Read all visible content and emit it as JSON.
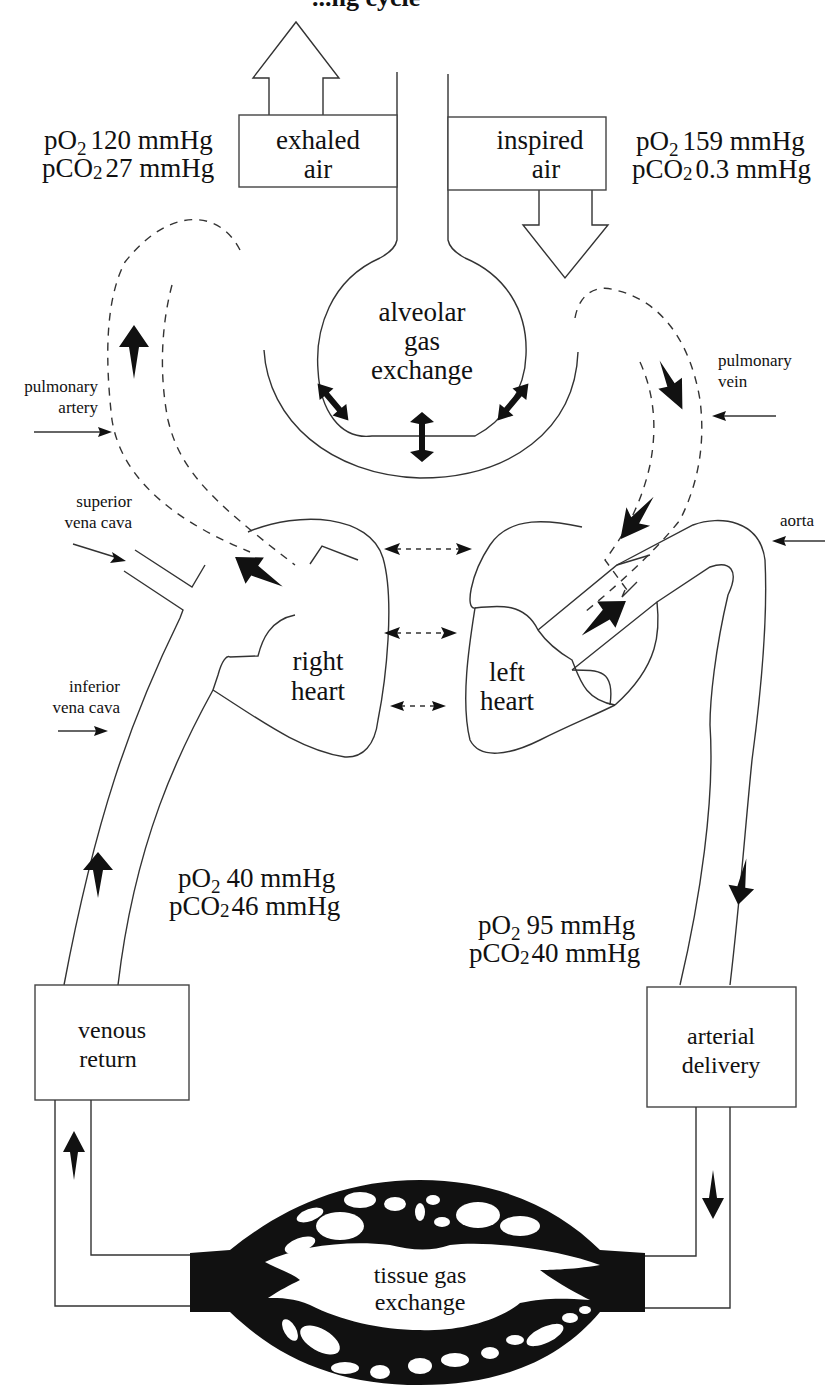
{
  "title_fragment": "...ng cycle",
  "top": {
    "exhaled_box": {
      "line1": "exhaled",
      "line2": "air"
    },
    "inspired_box": {
      "line1": "inspired",
      "line2": "air"
    },
    "exhaled_gas": {
      "po2_prefix": "pO",
      "po2_sub": "2",
      "po2_value": "120 mmHg",
      "pco2_prefix": "pCO",
      "pco2_sub": "2",
      "pco2_value": "27 mmHg"
    },
    "inspired_gas": {
      "po2_prefix": "pO",
      "po2_sub": "2",
      "po2_value": "159 mmHg",
      "pco2_prefix": "pCO",
      "pco2_sub": "2",
      "pco2_value": "0.3 mmHg"
    }
  },
  "alveolus": {
    "line1": "alveolar",
    "line2": "gas",
    "line3": "exchange"
  },
  "vessel_labels": {
    "pulmonary_artery": {
      "line1": "pulmonary",
      "line2": "artery"
    },
    "pulmonary_vein": {
      "line1": "pulmonary",
      "line2": "vein"
    },
    "superior_vena_cava": {
      "line1": "superior",
      "line2": "vena cava"
    },
    "inferior_vena_cava": {
      "line1": "inferior",
      "line2": "vena cava"
    },
    "aorta": {
      "line1": "aorta"
    }
  },
  "hearts": {
    "right": {
      "line1": "right",
      "line2": "heart"
    },
    "left": {
      "line1": "left",
      "line2": "heart"
    }
  },
  "venous_gas": {
    "po2_prefix": "pO",
    "po2_sub": "2",
    "po2_value": "40 mmHg",
    "pco2_prefix": "pCO",
    "pco2_sub": "2",
    "pco2_value": "46 mmHg"
  },
  "arterial_gas": {
    "po2_prefix": "pO",
    "po2_sub": "2",
    "po2_value": "95 mmHg",
    "pco2_prefix": "pCO",
    "pco2_sub": "2",
    "pco2_value": "40 mmHg"
  },
  "boxes": {
    "venous_return": {
      "line1": "venous",
      "line2": "return"
    },
    "arterial_delivery": {
      "line1": "arterial",
      "line2": "delivery"
    }
  },
  "tissue": {
    "line1": "tissue gas",
    "line2": "exchange"
  },
  "colors": {
    "ink": "#111111",
    "stroke": "#333333",
    "background": "#ffffff"
  }
}
